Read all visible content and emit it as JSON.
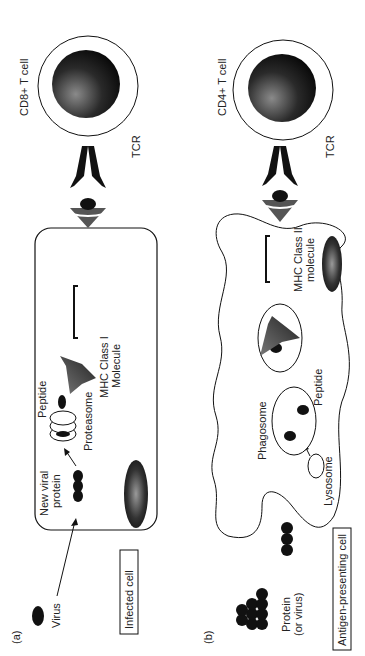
{
  "figure": {
    "orientation": "rotated -90deg",
    "panel_a": {
      "label": "(a)",
      "virus_label": "Virus",
      "box_label": "Infected cell",
      "new_protein_label_1": "New viral",
      "new_protein_label_2": "protein",
      "proteasome_label": "Proteasome",
      "peptide_label": "Peptide",
      "mhc_label_1": "MHC Class I",
      "mhc_label_2": "Molecule",
      "tcr_label": "TCR",
      "tcell_label": "CD8+ T cell"
    },
    "panel_b": {
      "label": "(b)",
      "protein_label_1": "Protein",
      "protein_label_2": "(or virus)",
      "box_label": "Antigen-presenting cell",
      "phagosome_label": "Phagosome",
      "peptide_label": "Peptide",
      "lysosome_label": "Lysosome",
      "mhc_label_1": "MHC Class II",
      "mhc_label_2": "molecule",
      "tcr_label": "TCR",
      "tcell_label": "CD4+ T cell"
    }
  },
  "colors": {
    "ink": "#111111",
    "mhc_gray": "#555555",
    "nucleus_light": "#888888",
    "background": "#ffffff"
  }
}
